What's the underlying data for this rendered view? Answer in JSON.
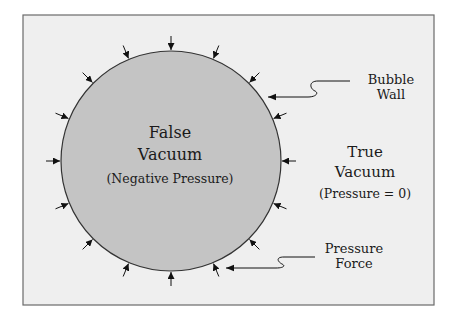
{
  "diagram": {
    "colors": {
      "page_background": "#ffffff",
      "frame_fill": "#efefef",
      "frame_border": "#6a6a6a",
      "bubble_fill": "#c4c4c4",
      "bubble_stroke": "#333333",
      "arrow_color": "#111111"
    },
    "bubble": {
      "title_line1": "False",
      "title_line2": "Vacuum",
      "subtitle": "(Negative Pressure)"
    },
    "outside": {
      "title_line1": "True",
      "title_line2": "Vacuum",
      "subtitle": "(Pressure = 0)"
    },
    "callouts": [
      {
        "line1": "Bubble",
        "line2": "Wall"
      },
      {
        "line1": "Pressure",
        "line2": "Force"
      }
    ],
    "pressure_arrow_count": 16
  }
}
